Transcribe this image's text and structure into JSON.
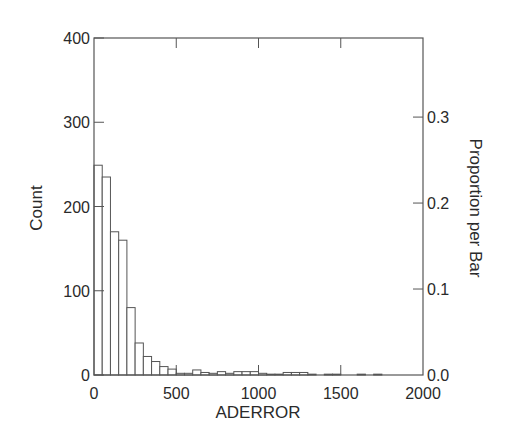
{
  "chart_data": {
    "type": "bar",
    "subtype": "histogram",
    "title": "",
    "xlabel": "ADERROR",
    "ylabel": "Count",
    "y2label": "Proportion per Bar",
    "xlim": [
      0,
      2000
    ],
    "ylim": [
      0,
      400
    ],
    "y2lim": [
      0,
      0.392
    ],
    "bin_width": 50,
    "x_ticks": [
      0,
      500,
      1000,
      1500,
      2000
    ],
    "x_tick_labels": [
      "0",
      "500",
      "1000",
      "1500",
      "2000"
    ],
    "y_ticks": [
      0,
      100,
      200,
      300,
      400
    ],
    "y_tick_labels": [
      "0",
      "100",
      "200",
      "300",
      "400"
    ],
    "y2_ticks": [
      0.0,
      0.1,
      0.2,
      0.3
    ],
    "y2_tick_labels": [
      "0.0",
      "0.1",
      "0.2",
      "0.3"
    ],
    "grid": false,
    "legend": null,
    "bar_fill": "#ffffff",
    "bar_stroke": "#555555",
    "bins": [
      {
        "x0": 0,
        "x1": 50,
        "count": 249
      },
      {
        "x0": 50,
        "x1": 100,
        "count": 235
      },
      {
        "x0": 100,
        "x1": 150,
        "count": 170
      },
      {
        "x0": 150,
        "x1": 200,
        "count": 160
      },
      {
        "x0": 200,
        "x1": 250,
        "count": 80
      },
      {
        "x0": 250,
        "x1": 300,
        "count": 38
      },
      {
        "x0": 300,
        "x1": 350,
        "count": 22
      },
      {
        "x0": 350,
        "x1": 400,
        "count": 16
      },
      {
        "x0": 400,
        "x1": 450,
        "count": 10
      },
      {
        "x0": 450,
        "x1": 500,
        "count": 7
      },
      {
        "x0": 500,
        "x1": 550,
        "count": 2
      },
      {
        "x0": 550,
        "x1": 600,
        "count": 2
      },
      {
        "x0": 600,
        "x1": 650,
        "count": 6
      },
      {
        "x0": 650,
        "x1": 700,
        "count": 3
      },
      {
        "x0": 700,
        "x1": 750,
        "count": 2
      },
      {
        "x0": 750,
        "x1": 800,
        "count": 4
      },
      {
        "x0": 800,
        "x1": 850,
        "count": 2
      },
      {
        "x0": 850,
        "x1": 900,
        "count": 4
      },
      {
        "x0": 900,
        "x1": 950,
        "count": 4
      },
      {
        "x0": 950,
        "x1": 1000,
        "count": 4
      },
      {
        "x0": 1000,
        "x1": 1050,
        "count": 2
      },
      {
        "x0": 1050,
        "x1": 1100,
        "count": 1
      },
      {
        "x0": 1100,
        "x1": 1150,
        "count": 1
      },
      {
        "x0": 1150,
        "x1": 1200,
        "count": 3
      },
      {
        "x0": 1200,
        "x1": 1250,
        "count": 3
      },
      {
        "x0": 1250,
        "x1": 1300,
        "count": 3
      },
      {
        "x0": 1300,
        "x1": 1350,
        "count": 1
      },
      {
        "x0": 1350,
        "x1": 1400,
        "count": 0
      },
      {
        "x0": 1400,
        "x1": 1450,
        "count": 1
      },
      {
        "x0": 1450,
        "x1": 1500,
        "count": 1
      },
      {
        "x0": 1500,
        "x1": 1550,
        "count": 0
      },
      {
        "x0": 1550,
        "x1": 1600,
        "count": 0
      },
      {
        "x0": 1600,
        "x1": 1650,
        "count": 1
      },
      {
        "x0": 1650,
        "x1": 1700,
        "count": 0
      },
      {
        "x0": 1700,
        "x1": 1750,
        "count": 1
      },
      {
        "x0": 1750,
        "x1": 1800,
        "count": 0
      },
      {
        "x0": 1800,
        "x1": 1850,
        "count": 0
      },
      {
        "x0": 1850,
        "x1": 1900,
        "count": 0
      },
      {
        "x0": 1900,
        "x1": 1950,
        "count": 0
      },
      {
        "x0": 1950,
        "x1": 2000,
        "count": 0
      }
    ],
    "categories": [
      "0-50",
      "50-100",
      "100-150",
      "150-200",
      "200-250",
      "250-300",
      "300-350",
      "350-400",
      "400-450",
      "450-500",
      "500-550",
      "550-600",
      "600-650",
      "650-700",
      "700-750",
      "750-800",
      "800-850",
      "850-900",
      "900-950",
      "950-1000",
      "1000-1050",
      "1050-1100",
      "1100-1150",
      "1150-1200",
      "1200-1250",
      "1250-1300",
      "1300-1350",
      "1350-1400",
      "1400-1450",
      "1450-1500",
      "1500-1550",
      "1550-1600",
      "1600-1650",
      "1650-1700",
      "1700-1750",
      "1750-1800",
      "1800-1850",
      "1850-1900",
      "1900-1950",
      "1950-2000"
    ],
    "values": [
      249,
      235,
      170,
      160,
      80,
      38,
      22,
      16,
      10,
      7,
      2,
      2,
      6,
      3,
      2,
      4,
      2,
      4,
      4,
      4,
      2,
      1,
      1,
      3,
      3,
      3,
      1,
      0,
      1,
      1,
      0,
      0,
      1,
      0,
      1,
      0,
      0,
      0,
      0,
      0
    ]
  }
}
